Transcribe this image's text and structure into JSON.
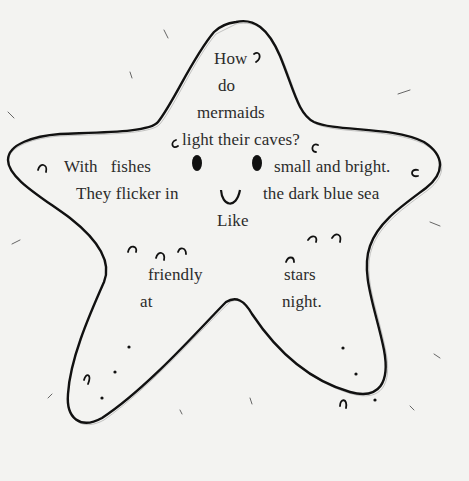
{
  "poem": {
    "lines": [
      {
        "text": "How",
        "x": 214,
        "y": 54
      },
      {
        "text": "do",
        "x": 218,
        "y": 81
      },
      {
        "text": "mermaids",
        "x": 197,
        "y": 108
      },
      {
        "text": "light their caves?",
        "x": 172,
        "y": 135
      },
      {
        "text": "With   fishes",
        "x": 64,
        "y": 162
      },
      {
        "text": "small and bright.",
        "x": 274,
        "y": 162
      },
      {
        "text": "They flicker in",
        "x": 76,
        "y": 189
      },
      {
        "text": "the dark blue sea",
        "x": 263,
        "y": 189
      },
      {
        "text": "Like",
        "x": 217,
        "y": 216
      },
      {
        "text": "friendly",
        "x": 148,
        "y": 270
      },
      {
        "text": "stars",
        "x": 284,
        "y": 270
      },
      {
        "text": "at",
        "x": 140,
        "y": 297
      },
      {
        "text": "night.",
        "x": 282,
        "y": 297
      }
    ]
  },
  "illustration": {
    "subject": "starfish",
    "outline_color": "#111111",
    "background_color": "#f3f3f1",
    "features": [
      "left-eye",
      "right-eye",
      "smile-mouth",
      "spots",
      "small-curls"
    ]
  }
}
